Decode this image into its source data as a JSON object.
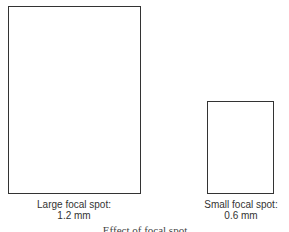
{
  "diagram": {
    "large": {
      "label_line1": "Large focal spot:",
      "label_line2": "1.2 mm"
    },
    "small": {
      "label_line1": "Small focal spot:",
      "label_line2": "0.6 mm"
    },
    "caption": "Effect of focal spot"
  },
  "colors": {
    "outline": "#333333",
    "background": "#ffffff"
  }
}
